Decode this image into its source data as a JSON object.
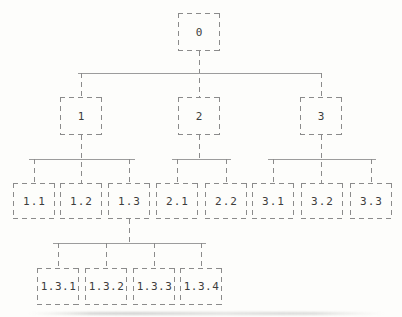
{
  "diagram": {
    "type": "tree",
    "colors": {
      "background": "#fdfdfb",
      "box_border": "#8b8b8b",
      "connector": "#9c9c9c",
      "text": "#3d3d3d"
    },
    "nodes": [
      {
        "id": "0",
        "label": "0",
        "parent": null,
        "level": 0
      },
      {
        "id": "1",
        "label": "1",
        "parent": "0",
        "level": 1
      },
      {
        "id": "2",
        "label": "2",
        "parent": "0",
        "level": 1
      },
      {
        "id": "3",
        "label": "3",
        "parent": "0",
        "level": 1
      },
      {
        "id": "1.1",
        "label": "1.1",
        "parent": "1",
        "level": 2
      },
      {
        "id": "1.2",
        "label": "1.2",
        "parent": "1",
        "level": 2
      },
      {
        "id": "1.3",
        "label": "1.3",
        "parent": "1",
        "level": 2
      },
      {
        "id": "2.1",
        "label": "2.1",
        "parent": "2",
        "level": 2
      },
      {
        "id": "2.2",
        "label": "2.2",
        "parent": "2",
        "level": 2
      },
      {
        "id": "3.1",
        "label": "3.1",
        "parent": "3",
        "level": 2
      },
      {
        "id": "3.2",
        "label": "3.2",
        "parent": "3",
        "level": 2
      },
      {
        "id": "3.3",
        "label": "3.3",
        "parent": "3",
        "level": 2
      },
      {
        "id": "1.3.1",
        "label": "1.3.1",
        "parent": "1.3",
        "level": 3
      },
      {
        "id": "1.3.2",
        "label": "1.3.2",
        "parent": "1.3",
        "level": 3
      },
      {
        "id": "1.3.3",
        "label": "1.3.3",
        "parent": "1.3",
        "level": 3
      },
      {
        "id": "1.3.4",
        "label": "1.3.4",
        "parent": "1.3",
        "level": 3
      }
    ]
  }
}
